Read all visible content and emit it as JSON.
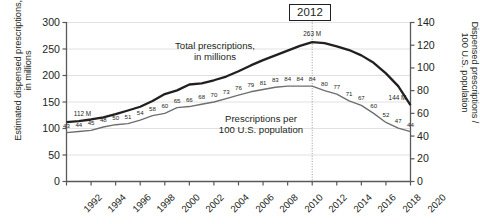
{
  "axes": {
    "left_title_line1": "Estimated dispensed prescriptions,",
    "left_title_line2": "in millions",
    "right_title_line1": "Dispensed prescriptions /",
    "right_title_line2": "100 U.S. population",
    "left_ticks": [
      "0",
      "50",
      "100",
      "150",
      "200",
      "250",
      "300"
    ],
    "right_ticks": [
      "0",
      "20",
      "40",
      "60",
      "80",
      "100",
      "120",
      "140"
    ],
    "x_ticks": [
      "1992",
      "1994",
      "1996",
      "1998",
      "2000",
      "2002",
      "2004",
      "2006",
      "2008",
      "2010",
      "2012",
      "2014",
      "2016",
      "2018",
      "2020"
    ]
  },
  "annotations": {
    "year_marker": "2012",
    "series_total_label_line1": "Total prescriptions,",
    "series_total_label_line2": "in millions",
    "series_per100_label_line1": "Prescriptions per",
    "series_per100_label_line2": "100 U.S. population",
    "total_start_label": "112 M",
    "total_peak_label": "263 M",
    "total_end_label": "144 M"
  },
  "colors": {
    "series_total": "#231f20",
    "series_per100": "#6d6e71",
    "axis": "#58595b",
    "grid": "#d9d9d9",
    "text": "#231f20",
    "marker_line": "#808080"
  },
  "chart_data": {
    "type": "line",
    "title": "",
    "xlabel": "",
    "ylabel": "Estimated dispensed prescriptions, in millions",
    "ylabel_right": "Dispensed prescriptions / 100 U.S. population",
    "grid": true,
    "legend_position": "inline",
    "xlim": [
      1992,
      2020
    ],
    "ylim": [
      0,
      300
    ],
    "ylim_right": [
      0,
      140
    ],
    "x": [
      1992,
      1993,
      1994,
      1995,
      1996,
      1997,
      1998,
      1999,
      2000,
      2001,
      2002,
      2003,
      2004,
      2005,
      2006,
      2007,
      2008,
      2009,
      2010,
      2011,
      2012,
      2013,
      2014,
      2015,
      2016,
      2017,
      2018,
      2019,
      2020
    ],
    "series": [
      {
        "name": "Total prescriptions, in millions",
        "axis": "left",
        "values": [
          112,
          114,
          117,
          121,
          127,
          134,
          141,
          152,
          165,
          172,
          183,
          185,
          191,
          198,
          208,
          219,
          229,
          238,
          247,
          256,
          263,
          261,
          255,
          248,
          238,
          224,
          204,
          180,
          144
        ],
        "labels": {
          "1992": "112 M",
          "2012": "263 M",
          "2020": "144 M"
        }
      },
      {
        "name": "Prescriptions per 100 U.S. population",
        "axis": "right",
        "values": [
          43,
          44,
          45,
          48,
          50,
          51,
          54,
          58,
          60,
          65,
          66,
          68,
          70,
          73,
          76,
          79,
          81,
          83,
          84,
          84,
          84,
          80,
          77,
          71,
          67,
          60,
          52,
          47,
          44
        ],
        "labels": [
          "43",
          "44",
          "45",
          "48",
          "50",
          "51",
          "54",
          "58",
          "60",
          "65",
          "66",
          "68",
          "70",
          "73",
          "76",
          "79",
          "81",
          "83",
          "84",
          "84",
          "84",
          "80",
          "77",
          "71",
          "67",
          "60",
          "52",
          "47",
          "44"
        ]
      }
    ],
    "annotations": [
      {
        "type": "vertical-line",
        "x": 2012,
        "label": "2012"
      }
    ]
  }
}
